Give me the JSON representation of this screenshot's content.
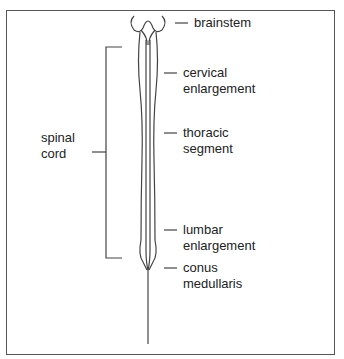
{
  "diagram": {
    "labels": {
      "brainstem": "brainstem",
      "cervical_1": "cervical",
      "cervical_2": "enlargement",
      "thoracic_1": "thoracic",
      "thoracic_2": "segment",
      "lumbar_1": "lumbar",
      "lumbar_2": "enlargement",
      "conus_1": "conus",
      "conus_2": "medullaris",
      "spinal_1": "spinal",
      "spinal_2": "cord"
    },
    "colors": {
      "line": "#444444",
      "text": "#222222"
    }
  }
}
